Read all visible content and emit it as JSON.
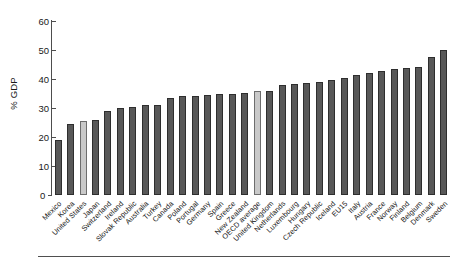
{
  "chart_data": {
    "type": "bar",
    "title": "",
    "xlabel": "",
    "ylabel": "% GDP",
    "ylim": [
      0,
      60
    ],
    "yticks": [
      0,
      10,
      20,
      30,
      40,
      50,
      60
    ],
    "grid": false,
    "legend_position": "none",
    "highlight_color": "#c9c9c9",
    "bar_color": "#585858",
    "highlighted_categories": [
      "United States",
      "OECD average"
    ],
    "categories": [
      "Mexico",
      "Korea",
      "United States",
      "Japan",
      "Switzerland",
      "Ireland",
      "Slovak Republic",
      "Australia",
      "Turkey",
      "Canada",
      "Poland",
      "Portugal",
      "Germany",
      "Spain",
      "Greece",
      "New Zealand",
      "OECD average",
      "United Kingdom",
      "Netherlands",
      "Luxembourg",
      "Hungary",
      "Czech Republic",
      "Iceland",
      "EU15",
      "Italy",
      "Austria",
      "France",
      "Norway",
      "Finland",
      "Belgium",
      "Denmark",
      "Sweden"
    ],
    "values": [
      19.0,
      24.5,
      25.5,
      26.0,
      29.0,
      30.0,
      30.2,
      31.0,
      31.2,
      33.5,
      34.2,
      34.2,
      34.5,
      34.7,
      35.0,
      35.2,
      35.8,
      35.8,
      38.0,
      38.2,
      38.5,
      39.0,
      39.5,
      40.5,
      41.5,
      42.0,
      42.8,
      43.5,
      43.8,
      44.0,
      47.5,
      50.0
    ]
  }
}
